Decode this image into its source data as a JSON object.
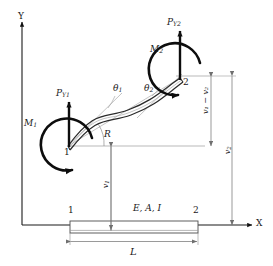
{
  "figure": {
    "axes": {
      "y_label": "Y",
      "x_label": "X"
    },
    "colors": {
      "ink": "#1a1a1a",
      "thin_line": "#8a8a8a",
      "dimension_line": "#7d7d7d",
      "beam_outline": "#5a5a5a",
      "background": "#ffffff"
    },
    "nodes": {
      "node1_deformed": "1",
      "node2_deformed": "2",
      "node1_original": "1",
      "node2_original": "2"
    },
    "forces": {
      "py1": "P",
      "py1_sub": "Y1",
      "py2": "P",
      "py2_sub": "Y2",
      "m1": "M",
      "m1_sub": "1",
      "m2": "M",
      "m2_sub": "2"
    },
    "rotations": {
      "theta1": "θ",
      "theta1_sub": "1",
      "theta2": "θ",
      "theta2_sub": "2",
      "chord_angle": "R"
    },
    "dimensions": {
      "v1": "v",
      "v1_sub": "1",
      "v2": "v",
      "v2_sub": "2",
      "v1_minus_v2": "v₁ − v₂",
      "length": "L"
    },
    "beam_properties": {
      "label": "E, A, I"
    }
  }
}
